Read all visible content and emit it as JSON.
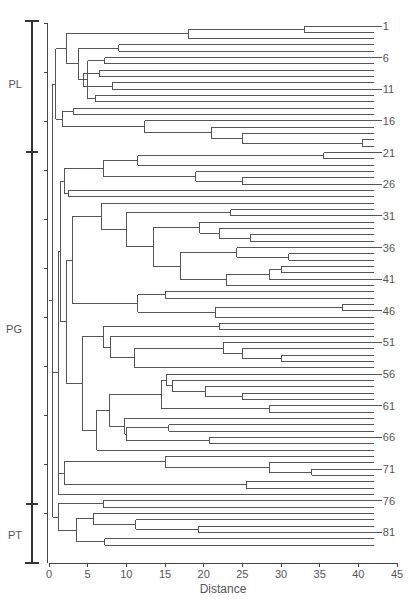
{
  "chart_data": {
    "type": "dendrogram",
    "title": "",
    "xlabel": "Distance",
    "ylabel": "",
    "xlim": [
      0,
      45
    ],
    "x_ticks": [
      0,
      5,
      10,
      15,
      20,
      25,
      30,
      35,
      40,
      45
    ],
    "leaf_count": 81,
    "leaf_end_distance": 42,
    "labeled_leaves": [
      1,
      6,
      11,
      16,
      21,
      26,
      31,
      36,
      41,
      46,
      51,
      56,
      61,
      66,
      71,
      76,
      81
    ],
    "groups": [
      {
        "name": "PL",
        "from_leaf": 1,
        "to_leaf": 20
      },
      {
        "name": "PG",
        "from_leaf": 21,
        "to_leaf": 75
      },
      {
        "name": "PT",
        "from_leaf": 76,
        "to_leaf": 81
      }
    ],
    "tree": {
      "h": 0.5,
      "c": [
        {
          "h": 0.9,
          "c": [
            {
              "h": 2.2,
              "c": [
                {
                  "h": 18,
                  "c": [
                    {
                      "h": 33,
                      "c": [
                        1,
                        2
                      ]
                    },
                    3
                  ]
                },
                {
                  "h": 3.8,
                  "c": [
                    {
                      "h": 9,
                      "c": [
                        4,
                        5
                      ]
                    },
                    {
                      "h": 5,
                      "c": [
                        {
                          "h": 7.2,
                          "c": [
                            6,
                            7
                          ]
                        },
                        {
                          "h": 4.4,
                          "c": [
                            {
                              "h": 6.5,
                              "c": [
                                8,
                                9
                              ]
                            },
                            {
                              "h": 8.2,
                              "c": [
                                10,
                                11
                              ]
                            }
                          ]
                        },
                        {
                          "h": 6,
                          "c": [
                            12,
                            13
                          ]
                        }
                      ]
                    }
                  ]
                }
              ]
            },
            {
              "h": 1.8,
              "c": [
                {
                  "h": 3.2,
                  "c": [
                    14,
                    15
                  ]
                },
                {
                  "h": 12.4,
                  "c": [
                    16,
                    {
                      "h": 21,
                      "c": [
                        17,
                        {
                          "h": 25,
                          "c": [
                            18,
                            {
                              "h": 40.5,
                              "c": [
                                19,
                                20
                              ]
                            }
                          ]
                        }
                      ]
                    }
                  ]
                }
              ]
            }
          ]
        },
        {
          "h": 1.2,
          "c": [
            {
              "h": 1.5,
              "c": [
                {
                  "h": 2,
                  "c": [
                    {
                      "h": 7,
                      "c": [
                        {
                          "h": 11.5,
                          "c": [
                            {
                              "h": 35.5,
                              "c": [
                                21,
                                22
                              ]
                            },
                            23
                          ]
                        },
                        {
                          "h": 19,
                          "c": [
                            24,
                            {
                              "h": 25,
                              "c": [
                                25,
                                26
                              ]
                            }
                          ]
                        }
                      ]
                    },
                    {
                      "h": 2.5,
                      "c": [
                        27,
                        28
                      ]
                    }
                  ]
                },
                {
                  "h": 2.3,
                  "c": [
                    {
                      "h": 3,
                      "c": [
                        {
                          "h": 6.8,
                          "c": [
                            29,
                            {
                              "h": 10,
                              "c": [
                                {
                                  "h": 23.5,
                                  "c": [
                                    30,
                                    31
                                  ]
                                },
                                {
                                  "h": 13.5,
                                  "c": [
                                    {
                                      "h": 19.5,
                                      "c": [
                                        32,
                                        {
                                          "h": 22,
                                          "c": [
                                            33,
                                            {
                                              "h": 26,
                                              "c": [
                                                34,
                                                35
                                              ]
                                            }
                                          ]
                                        }
                                      ]
                                    },
                                    {
                                      "h": 17,
                                      "c": [
                                        {
                                          "h": 24.3,
                                          "c": [
                                            36,
                                            {
                                              "h": 31,
                                              "c": [
                                                37,
                                                38
                                              ]
                                            }
                                          ]
                                        },
                                        {
                                          "h": 23,
                                          "c": [
                                            {
                                              "h": 28.5,
                                              "c": [
                                                {
                                                  "h": 30,
                                                  "c": [
                                                    39,
                                                    40
                                                  ]
                                                },
                                                41
                                              ]
                                            },
                                            42
                                          ]
                                        }
                                      ]
                                    }
                                  ]
                                }
                              ]
                            }
                          ]
                        },
                        {
                          "h": 11.5,
                          "c": [
                            {
                              "h": 15,
                              "c": [
                                43,
                                44
                              ]
                            },
                            {
                              "h": 21.5,
                              "c": [
                                {
                                  "h": 38,
                                  "c": [
                                    45,
                                    46
                                  ]
                                },
                                47
                              ]
                            }
                          ]
                        }
                      ]
                    },
                    {
                      "h": 4.3,
                      "c": [
                        {
                          "h": 7,
                          "c": [
                            {
                              "h": 22,
                              "c": [
                                48,
                                49
                              ]
                            },
                            {
                              "h": 8,
                              "c": [
                                50,
                                {
                                  "h": 11,
                                  "c": [
                                    {
                                      "h": 22.5,
                                      "c": [
                                        51,
                                        {
                                          "h": 25,
                                          "c": [
                                            52,
                                            {
                                              "h": 30,
                                              "c": [
                                                53,
                                                54
                                              ]
                                            }
                                          ]
                                        }
                                      ]
                                    },
                                    55
                                  ]
                                }
                              ]
                            }
                          ]
                        },
                        {
                          "h": 6.2,
                          "c": [
                            {
                              "h": 7.8,
                              "c": [
                                {
                                  "h": 14.5,
                                  "c": [
                                    {
                                      "h": 15.2,
                                      "c": [
                                        56,
                                        {
                                          "h": 16,
                                          "c": [
                                            57,
                                            {
                                              "h": 20.2,
                                              "c": [
                                                58,
                                                {
                                                  "h": 25,
                                                  "c": [
                                                    59,
                                                    60
                                                  ]
                                                }
                                              ]
                                            }
                                          ]
                                        }
                                      ]
                                    },
                                    {
                                      "h": 28.5,
                                      "c": [
                                        61,
                                        62
                                      ]
                                    }
                                  ]
                                },
                                {
                                  "h": 9.8,
                                  "c": [
                                    63,
                                    {
                                      "h": 10,
                                      "c": [
                                        {
                                          "h": 15.5,
                                          "c": [
                                            64,
                                            65
                                          ]
                                        },
                                        {
                                          "h": 20.8,
                                          "c": [
                                            66,
                                            67
                                          ]
                                        }
                                      ]
                                    }
                                  ]
                                }
                              ]
                            },
                            68
                          ]
                        }
                      ]
                    }
                  ]
                }
              ]
            },
            {
              "h": 2,
              "c": [
                {
                  "h": 15,
                  "c": [
                    69,
                    {
                      "h": 28.5,
                      "c": [
                        70,
                        {
                          "h": 34,
                          "c": [
                            71,
                            72
                          ]
                        }
                      ]
                    }
                  ]
                },
                {
                  "h": 25.5,
                  "c": [
                    73,
                    74
                  ]
                }
              ]
            },
            75
          ]
        },
        {
          "h": 1.2,
          "c": [
            {
              "h": 7,
              "c": [
                76,
                77
              ]
            },
            {
              "h": 3.5,
              "c": [
                {
                  "h": 5.7,
                  "c": [
                    78,
                    {
                      "h": 11.2,
                      "c": [
                        79,
                        {
                          "h": 19.3,
                          "c": [
                            80,
                            81
                          ]
                        }
                      ]
                    }
                  ]
                },
                {
                  "h": 7.2,
                  "c": [
                    82,
                    83
                  ]
                }
              ]
            }
          ]
        }
      ]
    }
  }
}
